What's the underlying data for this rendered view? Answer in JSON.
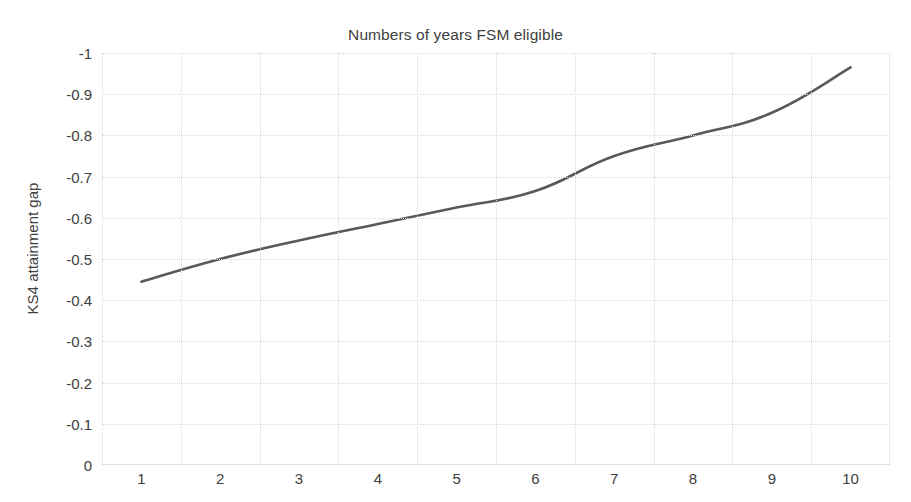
{
  "chart_data": {
    "type": "line",
    "title": "Numbers of years FSM eligible",
    "xlabel": "",
    "ylabel": "KS4 attainment gap",
    "categories": [
      "1",
      "2",
      "3",
      "4",
      "5",
      "6",
      "7",
      "8",
      "9",
      "10"
    ],
    "values": [
      -0.445,
      -0.5,
      -0.545,
      -0.585,
      -0.625,
      -0.665,
      -0.75,
      -0.8,
      -0.855,
      -0.965
    ],
    "series": [
      {
        "name": "KS4 attainment gap",
        "values": [
          -0.445,
          -0.5,
          -0.545,
          -0.585,
          -0.625,
          -0.665,
          -0.75,
          -0.8,
          -0.855,
          -0.965
        ]
      }
    ],
    "ylim": [
      -1,
      0
    ],
    "y_ticks": [
      "-1",
      "-0.9",
      "-0.8",
      "-0.7",
      "-0.6",
      "-0.5",
      "-0.4",
      "-0.3",
      "-0.2",
      "-0.1",
      "0"
    ],
    "y_tick_values": [
      -1,
      -0.9,
      -0.8,
      -0.7,
      -0.6,
      -0.5,
      -0.4,
      -0.3,
      -0.2,
      -0.1,
      0
    ],
    "y_axis_inverted": true,
    "grid": true,
    "legend": false,
    "legend_position": "none",
    "line_color": "#595959",
    "grid_color": "#d9d9d9",
    "background_color": "#ffffff",
    "text_color": "#404040"
  }
}
